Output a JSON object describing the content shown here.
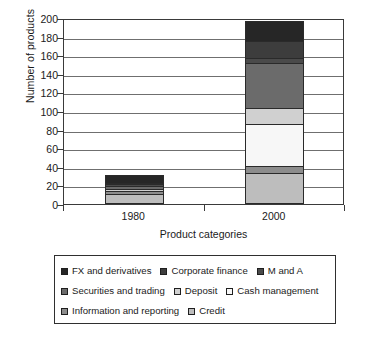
{
  "chart_data": {
    "type": "bar",
    "subtype": "stacked-column",
    "title": "",
    "xlabel": "Product categories",
    "ylabel": "Number of products",
    "categories": [
      "1980",
      "2000"
    ],
    "ylim": [
      0,
      200
    ],
    "yticks": [
      0,
      20,
      40,
      60,
      80,
      100,
      120,
      140,
      160,
      180,
      200
    ],
    "ytick_labels": [
      "0",
      "20",
      "40",
      "60",
      "80",
      "100",
      "120",
      "140",
      "160",
      "180",
      "200"
    ],
    "grid": true,
    "grid_axis": "y",
    "legend_position": "below",
    "stack_order_bottom_to_top": [
      "Credit",
      "Information and reporting",
      "Cash management",
      "Deposit",
      "Securities and trading",
      "M and A",
      "Corporate finance",
      "FX and derivatives"
    ],
    "series": [
      {
        "name": "FX and derivatives",
        "values": [
          8,
          22
        ],
        "color": "#262626"
      },
      {
        "name": "Corporate finance",
        "values": [
          2,
          18
        ],
        "color": "#3d3d3d"
      },
      {
        "name": "M and A",
        "values": [
          2,
          5
        ],
        "color": "#4a4a4a"
      },
      {
        "name": "Securities and trading",
        "values": [
          3,
          49
        ],
        "color": "#6b6b6b"
      },
      {
        "name": "Deposit",
        "values": [
          2,
          17
        ],
        "color": "#d0d0d0"
      },
      {
        "name": "Cash management",
        "values": [
          0,
          45
        ],
        "color": "#f7f7f7"
      },
      {
        "name": "Information and reporting",
        "values": [
          3,
          8
        ],
        "color": "#8c8c8c"
      },
      {
        "name": "Credit",
        "values": [
          11,
          33
        ],
        "color": "#bdbdbd"
      }
    ],
    "totals": [
      31,
      197
    ],
    "annotations": []
  },
  "legend": {
    "rows": [
      [
        {
          "label": "FX and derivatives",
          "color": "#262626"
        },
        {
          "label": "Corporate finance",
          "color": "#3d3d3d"
        },
        {
          "label": "M and A",
          "color": "#4a4a4a"
        }
      ],
      [
        {
          "label": "Securities and trading",
          "color": "#6b6b6b"
        },
        {
          "label": "Deposit",
          "color": "#d0d0d0"
        },
        {
          "label": "Cash management",
          "color": "#f7f7f7"
        }
      ],
      [
        {
          "label": "Information and reporting",
          "color": "#8c8c8c"
        },
        {
          "label": "Credit",
          "color": "#bdbdbd"
        }
      ]
    ]
  }
}
